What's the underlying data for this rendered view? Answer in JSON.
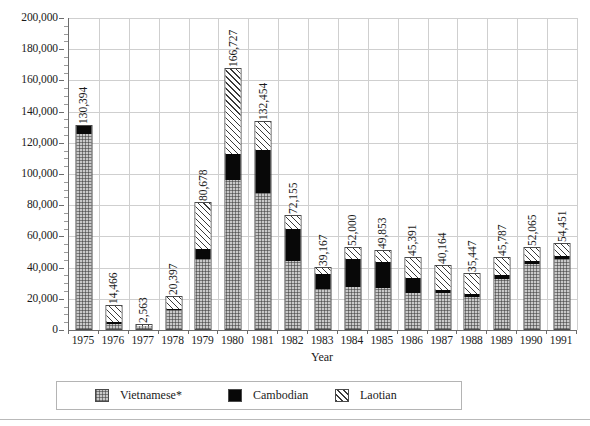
{
  "chart_data": {
    "type": "bar",
    "subtype": "stacked-vertical",
    "title": "",
    "xlabel": "Year",
    "ylabel": "",
    "ylim": [
      0,
      200000
    ],
    "ytick_step": 20000,
    "grid": true,
    "legend_position": "bottom",
    "categories": [
      "1975",
      "1976",
      "1977",
      "1978",
      "1979",
      "1980",
      "1981",
      "1982",
      "1983",
      "1984",
      "1985",
      "1986",
      "1987",
      "1988",
      "1989",
      "1990",
      "1991"
    ],
    "ytick_labels": [
      "0",
      "20,000",
      "40,000",
      "60,000",
      "80,000",
      "100,000",
      "120,000",
      "140,000",
      "160,000",
      "180,000",
      "200,000"
    ],
    "ytick_values": [
      0,
      20000,
      40000,
      60000,
      80000,
      100000,
      120000,
      140000,
      160000,
      180000,
      200000
    ],
    "series": [
      {
        "name": "Vietnamese*",
        "pattern": "cross-hatch",
        "color": "#c9c9c9",
        "values": [
          125000,
          3300,
          1900,
          12400,
          44800,
          95300,
          87000,
          43500,
          25500,
          27100,
          26200,
          23200,
          23400,
          20800,
          32200,
          41500,
          45200
        ]
      },
      {
        "name": "Cambodian",
        "pattern": "solid-black",
        "color": "#080808",
        "values": [
          5394,
          1100,
          300,
          700,
          6200,
          17200,
          27500,
          20500,
          9800,
          17600,
          16900,
          9400,
          1700,
          1800,
          2200,
          2200,
          1700
        ]
      },
      {
        "name": "Laotian",
        "pattern": "diagonal-hatch",
        "color": "#ffffff",
        "values": [
          0,
          10066,
          363,
          7297,
          29678,
          54227,
          17954,
          8155,
          3867,
          7300,
          6753,
          12791,
          15064,
          12847,
          11387,
          8365,
          7551
        ]
      }
    ],
    "totals": [
      130394,
      14466,
      2563,
      20397,
      80678,
      166727,
      132454,
      72155,
      39167,
      52000,
      49853,
      45391,
      40164,
      35447,
      45787,
      52065,
      54451
    ],
    "total_labels": [
      "130,394",
      "14,466",
      "2,563",
      "20,397",
      "80,678",
      "166,727",
      "132,454",
      "72,155",
      "39,167",
      "52,000",
      "49,853",
      "45,391",
      "40,164",
      "35,447",
      "45,787",
      "52,065",
      "54,451"
    ],
    "legend": [
      {
        "label": "Vietnamese*",
        "pattern": "cross-hatch"
      },
      {
        "label": "Cambodian",
        "pattern": "solid-black"
      },
      {
        "label": "Laotian",
        "pattern": "diagonal-hatch"
      }
    ]
  }
}
